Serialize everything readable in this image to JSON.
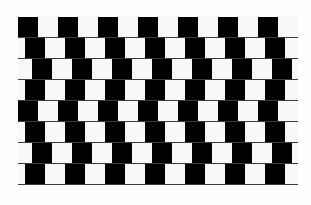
{
  "figure": {
    "name": "cafe-wall-illusion",
    "rows": 8,
    "tile_size": 20,
    "period": 40,
    "row_offsets": [
      0,
      7,
      14,
      7,
      0,
      7,
      14,
      7
    ],
    "colors": {
      "dark": "#000000",
      "light": "#f8f8f8",
      "mortar": "#3a3a3a",
      "background": "#fdfdfd"
    }
  }
}
